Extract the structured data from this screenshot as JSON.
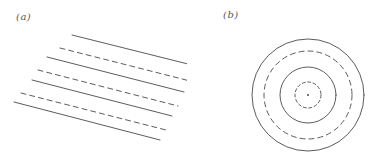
{
  "figure": {
    "width": 374,
    "height": 166,
    "background_color": "#ffffff",
    "stroke_color": "#4a4a4a",
    "label_color": "#5a5a5a",
    "stroke_width": 0.9
  },
  "panels": [
    {
      "id": "a",
      "label": "(a)",
      "label_x": 16,
      "label_y": 12,
      "kind": "plane-wavefronts",
      "description": "Parallel straight wavefronts alternating solid and dashed"
    },
    {
      "id": "b",
      "label": "(b)",
      "label_x": 36,
      "label_y": 10,
      "kind": "circular-wavefronts",
      "description": "Concentric circular wavefronts alternating solid and dashed about a central source point"
    }
  ],
  "chart_data": {
    "type": "line",
    "title": "",
    "xlabel": "",
    "ylabel": "",
    "panel_a": {
      "type": "line",
      "title": "",
      "geometry": "parallel-lines",
      "slope_degrees": 14,
      "line_count": 7,
      "solid_count": 4,
      "dashed_count": 3,
      "dash_pattern": "5 4",
      "lines": [
        {
          "index": 0,
          "style": "solid",
          "x1": 72,
          "y1": 35,
          "x2": 196,
          "y2": 66
        },
        {
          "index": 1,
          "style": "dashed",
          "x1": 60,
          "y1": 48,
          "x2": 190,
          "y2": 81
        },
        {
          "index": 2,
          "style": "solid",
          "x1": 47,
          "y1": 57,
          "x2": 184,
          "y2": 92
        },
        {
          "index": 3,
          "style": "dashed",
          "x1": 38,
          "y1": 70,
          "x2": 178,
          "y2": 106
        },
        {
          "index": 4,
          "style": "solid",
          "x1": 32,
          "y1": 80,
          "x2": 172,
          "y2": 116
        },
        {
          "index": 5,
          "style": "dashed",
          "x1": 21,
          "y1": 93,
          "x2": 166,
          "y2": 130
        },
        {
          "index": 6,
          "style": "solid",
          "x1": 14,
          "y1": 102,
          "x2": 160,
          "y2": 140
        }
      ]
    },
    "panel_b": {
      "type": "line",
      "title": "",
      "geometry": "concentric-circles",
      "center_x": 121,
      "center_y": 95,
      "ring_count": 4,
      "solid_count": 2,
      "dashed_count": 2,
      "center_point_radius": 1.1,
      "rings": [
        {
          "index": 0,
          "style": "solid",
          "radius": 56,
          "dash_pattern": ""
        },
        {
          "index": 1,
          "style": "dashed",
          "radius": 44,
          "dash_pattern": "5 4"
        },
        {
          "index": 2,
          "style": "solid",
          "radius": 28,
          "dash_pattern": ""
        },
        {
          "index": 3,
          "style": "dashed",
          "radius": 13,
          "dash_pattern": "3 2.5"
        }
      ]
    }
  }
}
